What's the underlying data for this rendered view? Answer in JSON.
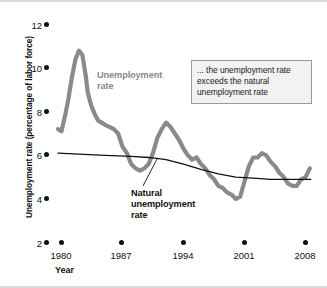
{
  "figure": {
    "y_axis_title": "Unemployment rate (percentage of labor force)",
    "x_axis_title": "Year",
    "annotation": "... the unemployment rate exceeds the natural unemployment rate",
    "series_label_unemployment": "Unemployment rate",
    "series_label_natural": "Natural unemployment rate",
    "colors": {
      "unemployment_rate": "#8a8a8a",
      "natural_rate": "#111111",
      "annotation_background": "#f2f2f2",
      "annotation_border": "#9a9a9a",
      "axis_text": "#111111"
    }
  },
  "chart_data": {
    "type": "line",
    "title": "",
    "subtitle": "",
    "xlabel": "Year",
    "ylabel": "Unemployment rate (percentage of labor force)",
    "xlim": [
      1979,
      2009
    ],
    "ylim": [
      2,
      12
    ],
    "xticks": [
      1980,
      1987,
      1994,
      2001,
      2008
    ],
    "xtick_labels": [
      "1980",
      "1987",
      "1994",
      "2001",
      "2008"
    ],
    "yticks": [
      2,
      4,
      6,
      8,
      10,
      12
    ],
    "ytick_labels": [
      "2",
      "4",
      "6",
      "8",
      "10",
      "12"
    ],
    "grid": false,
    "legend_position": "inline-annotations",
    "annotations": [
      {
        "text": "... the unemployment rate exceeds the natural unemployment rate",
        "kind": "callout-box"
      },
      {
        "text": "Unemployment rate",
        "kind": "series-label",
        "series": "Unemployment rate"
      },
      {
        "text": "Natural unemployment rate",
        "kind": "series-label-with-leader",
        "series": "Natural unemployment rate"
      }
    ],
    "series": [
      {
        "name": "Unemployment rate",
        "color": "#8a8a8a",
        "x": [
          1979.6,
          1980.0,
          1980.4,
          1980.8,
          1981.2,
          1981.6,
          1982.0,
          1982.4,
          1982.8,
          1983.0,
          1983.4,
          1983.8,
          1984.2,
          1984.6,
          1985.0,
          1985.5,
          1986.0,
          1986.5,
          1987.0,
          1987.5,
          1988.0,
          1988.5,
          1989.0,
          1989.5,
          1990.0,
          1990.5,
          1991.0,
          1991.5,
          1992.0,
          1992.5,
          1993.0,
          1993.5,
          1994.0,
          1994.5,
          1995.0,
          1995.5,
          1996.0,
          1996.5,
          1997.0,
          1997.5,
          1998.0,
          1998.5,
          1999.0,
          1999.5,
          2000.0,
          2000.5,
          2001.0,
          2001.5,
          2002.0,
          2002.5,
          2003.0,
          2003.5,
          2004.0,
          2004.5,
          2005.0,
          2005.5,
          2006.0,
          2006.5,
          2007.0,
          2007.5,
          2008.0,
          2008.5
        ],
        "y": [
          7.2,
          7.1,
          7.8,
          8.6,
          9.6,
          10.4,
          10.8,
          10.6,
          9.6,
          8.9,
          8.3,
          7.9,
          7.6,
          7.5,
          7.4,
          7.3,
          7.2,
          7.0,
          6.4,
          6.1,
          5.6,
          5.4,
          5.3,
          5.4,
          5.6,
          6.1,
          6.8,
          7.2,
          7.5,
          7.3,
          7.0,
          6.7,
          6.3,
          6.0,
          5.8,
          5.9,
          5.6,
          5.4,
          5.1,
          4.9,
          4.6,
          4.5,
          4.3,
          4.2,
          4.0,
          4.1,
          4.8,
          5.5,
          5.9,
          5.9,
          6.1,
          6.0,
          5.7,
          5.5,
          5.2,
          5.0,
          4.7,
          4.6,
          4.6,
          4.9,
          5.0,
          5.4
        ],
        "notable_points": {
          "peak": {
            "x": 1982.2,
            "y": 10.8
          },
          "trough_1989": {
            "x": 1989.2,
            "y": 5.3
          },
          "peak_1992": {
            "x": 1992.1,
            "y": 7.5
          },
          "trough_2000": {
            "x": 2000.2,
            "y": 4.0
          },
          "peak_2003": {
            "x": 2003.1,
            "y": 6.1
          },
          "end": {
            "x": 2008.5,
            "y": 5.4
          }
        }
      },
      {
        "name": "Natural unemployment rate",
        "color": "#111111",
        "x": [
          1979.6,
          1982.0,
          1985.0,
          1988.0,
          1990.0,
          1992.0,
          1994.0,
          1996.0,
          1998.0,
          2000.0,
          2002.0,
          2004.0,
          2006.0,
          2008.6
        ],
        "y": [
          6.1,
          6.05,
          6.0,
          5.95,
          5.9,
          5.8,
          5.6,
          5.35,
          5.15,
          5.0,
          4.95,
          4.9,
          4.9,
          4.9
        ]
      }
    ]
  }
}
